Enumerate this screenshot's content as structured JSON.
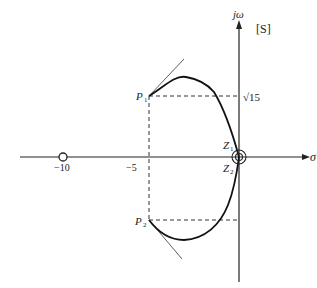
{
  "diagram": {
    "type": "root-locus",
    "plane_label": "[S]",
    "axes": {
      "real_axis_label": "σ",
      "imag_axis_label": "jω"
    },
    "tick_labels": {
      "minus_ten": "−10",
      "minus_five": "−5",
      "sqrt15": "√15"
    },
    "poles": [
      {
        "name": "P",
        "sub": "1",
        "position": "upper"
      },
      {
        "name": "P",
        "sub": "2",
        "position": "lower"
      }
    ],
    "zeros": [
      {
        "name": "Z",
        "sub": "1"
      },
      {
        "name": "Z",
        "sub": "2"
      }
    ],
    "colors": {
      "line": "#222222",
      "dash": "#333333",
      "background": "#ffffff"
    }
  }
}
